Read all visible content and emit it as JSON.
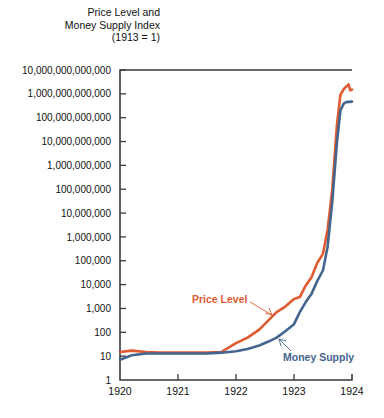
{
  "chart_data": {
    "type": "line",
    "title": "Price Level and Money Supply Index (1913 = 1)",
    "title_lines": [
      "Price Level and",
      "Money Supply Index",
      "(1913 = 1)"
    ],
    "xlabel": "",
    "ylabel": "",
    "yscale": "log",
    "ylim": [
      1,
      10000000000000
    ],
    "xlim": [
      1920,
      1924
    ],
    "grid": false,
    "legend_position": "inline-annotations",
    "ytick_labels": [
      "10,000,000,000,000",
      "1,000,000,000,000",
      "100,000,000,000",
      "10,000,000,000",
      "1,000,000,000",
      "100,000,000",
      "10,000,000",
      "1,000,000",
      "100,000",
      "10,000",
      "1,000",
      "100",
      "10",
      "1"
    ],
    "ytick_values": [
      10000000000000.0,
      1000000000000.0,
      100000000000.0,
      10000000000.0,
      1000000000.0,
      100000000.0,
      10000000.0,
      1000000.0,
      100000.0,
      10000.0,
      1000.0,
      100,
      10,
      1
    ],
    "xtick_labels": [
      "1920",
      "1921",
      "1922",
      "1923",
      "1924"
    ],
    "xtick_values": [
      1920,
      1921,
      1922,
      1923,
      1924
    ],
    "series": [
      {
        "name": "Price Level",
        "color": "#E05A32",
        "label_color": "#E05A32",
        "x": [
          1920.0,
          1920.2,
          1920.45,
          1920.7,
          1921.0,
          1921.25,
          1921.5,
          1921.75,
          1922.0,
          1922.2,
          1922.4,
          1922.55,
          1922.7,
          1922.85,
          1923.0,
          1923.1,
          1923.2,
          1923.3,
          1923.4,
          1923.5,
          1923.58,
          1923.66,
          1923.74,
          1923.8,
          1923.86,
          1923.9,
          1923.94,
          1923.97,
          1924.0
        ],
        "y": [
          15,
          17,
          15,
          14,
          14,
          14,
          14,
          15,
          35,
          60,
          130,
          300,
          700,
          1200,
          2500,
          3000,
          9000,
          20000,
          80000,
          200000,
          2000000,
          100000000,
          50000000000,
          900000000000,
          1600000000000,
          2000000000000,
          2500000000000,
          1400000000000,
          1500000000000
        ]
      },
      {
        "name": "Money Supply",
        "color": "#44658E",
        "label_color": "#44658E",
        "x": [
          1920.0,
          1920.2,
          1920.45,
          1920.7,
          1921.0,
          1921.25,
          1921.5,
          1921.75,
          1922.0,
          1922.2,
          1922.4,
          1922.55,
          1922.7,
          1922.85,
          1923.0,
          1923.1,
          1923.2,
          1923.3,
          1923.4,
          1923.5,
          1923.58,
          1923.66,
          1923.74,
          1923.8,
          1923.86,
          1923.9,
          1923.95,
          1924.0
        ],
        "y": [
          7,
          11,
          13,
          13,
          13,
          13,
          13,
          14,
          16,
          20,
          28,
          40,
          60,
          110,
          220,
          700,
          1800,
          4000,
          14000,
          40000,
          400000,
          30000000,
          9000000000,
          200000000000,
          400000000000,
          450000000000,
          460000000000,
          470000000000
        ]
      }
    ],
    "annotations": [
      {
        "text": "Price Level",
        "series": "Price Level",
        "color": "#E05A32"
      },
      {
        "text": "Money Supply",
        "series": "Money Supply",
        "color": "#44658E"
      }
    ]
  }
}
